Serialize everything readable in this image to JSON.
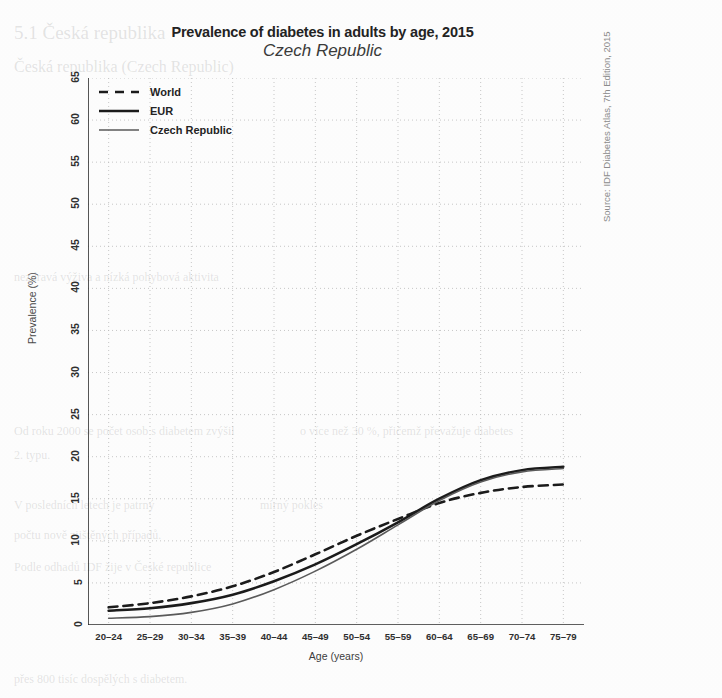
{
  "figure": {
    "title": "Prevalence of diabetes in adults by age, 2015",
    "subtitle": "Czech Republic",
    "source_note": "Source: IDF Diabetes Atlas, 7th Edition, 2015"
  },
  "legend": {
    "items": [
      {
        "label": "World",
        "style": "dashed",
        "color": "#1b1b1b",
        "width": 2.6
      },
      {
        "label": "EUR",
        "style": "solid",
        "color": "#1b1b1b",
        "width": 2.6
      },
      {
        "label": "Czech Republic",
        "style": "solid",
        "color": "#5a5a5a",
        "width": 1.6
      }
    ]
  },
  "background_text": {
    "lines": [
      {
        "text": "5.1  Česká republika",
        "x": 14,
        "y": 22,
        "size": 19
      },
      {
        "text": "Česká republika (Czech Republic)",
        "x": 14,
        "y": 58,
        "size": 16
      },
      {
        "text": "nezdravá výživa a nízká pohybová aktivita",
        "x": 14,
        "y": 270,
        "size": 12
      },
      {
        "text": "Od roku 2000 se počet osob s diabetem zvýšil",
        "x": 14,
        "y": 424,
        "size": 12
      },
      {
        "text": "o více než 30 %, přičemž převažuje diabetes",
        "x": 300,
        "y": 424,
        "size": 12
      },
      {
        "text": "2. typu.",
        "x": 14,
        "y": 448,
        "size": 12
      },
      {
        "text": "V posledních letech je patrný",
        "x": 14,
        "y": 498,
        "size": 12
      },
      {
        "text": "mírný pokles",
        "x": 260,
        "y": 498,
        "size": 12
      },
      {
        "text": "počtu nově zjištěných případů.",
        "x": 14,
        "y": 528,
        "size": 12
      },
      {
        "text": "Podle odhadů IDF žije v České republice",
        "x": 14,
        "y": 560,
        "size": 12
      },
      {
        "text": "přes 800 tisíc dospělých s diabetem.",
        "x": 14,
        "y": 672,
        "size": 12
      }
    ]
  },
  "chart_data": {
    "type": "line",
    "title": "Prevalence of diabetes in adults by age, 2015",
    "subtitle": "Czech Republic",
    "xlabel": "Age (years)",
    "ylabel": "Prevalence (%)",
    "grid": true,
    "legend_position": "top-left",
    "ylim": [
      0,
      65
    ],
    "yticks": [
      0,
      5,
      10,
      15,
      20,
      25,
      30,
      35,
      40,
      45,
      50,
      55,
      60,
      65
    ],
    "categories": [
      "20–24",
      "25–29",
      "30–34",
      "35–39",
      "40–44",
      "45–49",
      "50–54",
      "55–59",
      "60–64",
      "65–69",
      "70–74",
      "75–79"
    ],
    "series": [
      {
        "name": "World",
        "style": "dashed",
        "color": "#1b1b1b",
        "width": 2.6,
        "values": [
          2.1,
          2.6,
          3.4,
          4.6,
          6.3,
          8.4,
          10.6,
          12.6,
          14.5,
          15.7,
          16.4,
          16.7
        ]
      },
      {
        "name": "EUR",
        "style": "solid",
        "color": "#1b1b1b",
        "width": 2.6,
        "values": [
          1.7,
          2.0,
          2.6,
          3.6,
          5.2,
          7.2,
          9.6,
          12.2,
          15.0,
          17.2,
          18.4,
          18.8
        ]
      },
      {
        "name": "Czech Republic",
        "style": "solid",
        "color": "#5a5a5a",
        "width": 1.6,
        "values": [
          0.8,
          1.0,
          1.5,
          2.5,
          4.2,
          6.4,
          9.0,
          11.9,
          14.8,
          17.0,
          18.2,
          18.6
        ]
      }
    ]
  }
}
